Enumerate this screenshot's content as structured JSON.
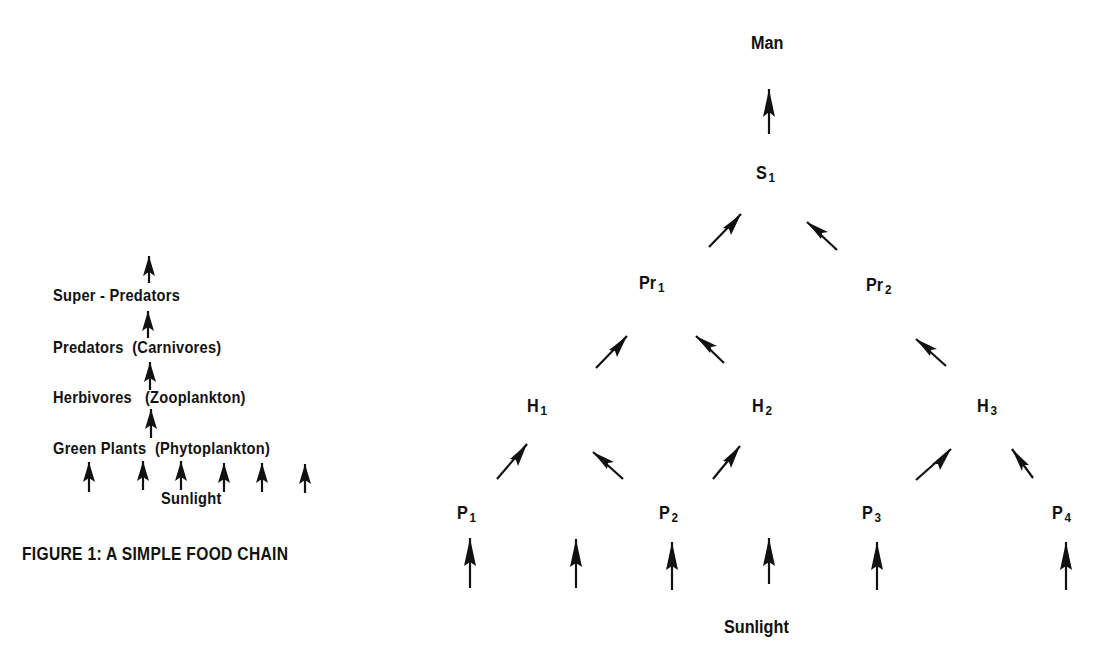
{
  "figure1": {
    "caption": "FIGURE 1:  A SIMPLE FOOD CHAIN",
    "levels": [
      {
        "label": "Super - Predators",
        "qualifier": ""
      },
      {
        "label": "Predators",
        "qualifier": "(Carnivores)"
      },
      {
        "label": "Herbivores",
        "qualifier": "(Zooplankton)"
      },
      {
        "label": "Green Plants",
        "qualifier": "(Phytoplankton)"
      }
    ],
    "source": "Sunlight"
  },
  "figure2": {
    "top": "Man",
    "super_predators": [
      {
        "base": "S",
        "sub": "1"
      }
    ],
    "predators": [
      {
        "base": "Pr",
        "sub": "1"
      },
      {
        "base": "Pr",
        "sub": "2"
      }
    ],
    "herbivores": [
      {
        "base": "H",
        "sub": "1"
      },
      {
        "base": "H",
        "sub": "2"
      },
      {
        "base": "H",
        "sub": "3"
      }
    ],
    "plants": [
      {
        "base": "P",
        "sub": "1"
      },
      {
        "base": "P",
        "sub": "2"
      },
      {
        "base": "P",
        "sub": "3"
      },
      {
        "base": "P",
        "sub": "4"
      }
    ],
    "source": "Sunlight",
    "edges": [
      [
        "Sunlight",
        "P1"
      ],
      [
        "Sunlight",
        "P2"
      ],
      [
        "Sunlight",
        "P3"
      ],
      [
        "Sunlight",
        "P4"
      ],
      [
        "P1",
        "H1"
      ],
      [
        "P2",
        "H1"
      ],
      [
        "P2",
        "H2"
      ],
      [
        "P3",
        "H3"
      ],
      [
        "P4",
        "H3"
      ],
      [
        "H1",
        "Pr1"
      ],
      [
        "H2",
        "Pr1"
      ],
      [
        "H3",
        "Pr2"
      ],
      [
        "Pr1",
        "S1"
      ],
      [
        "Pr2",
        "S1"
      ],
      [
        "S1",
        "Man"
      ]
    ]
  }
}
